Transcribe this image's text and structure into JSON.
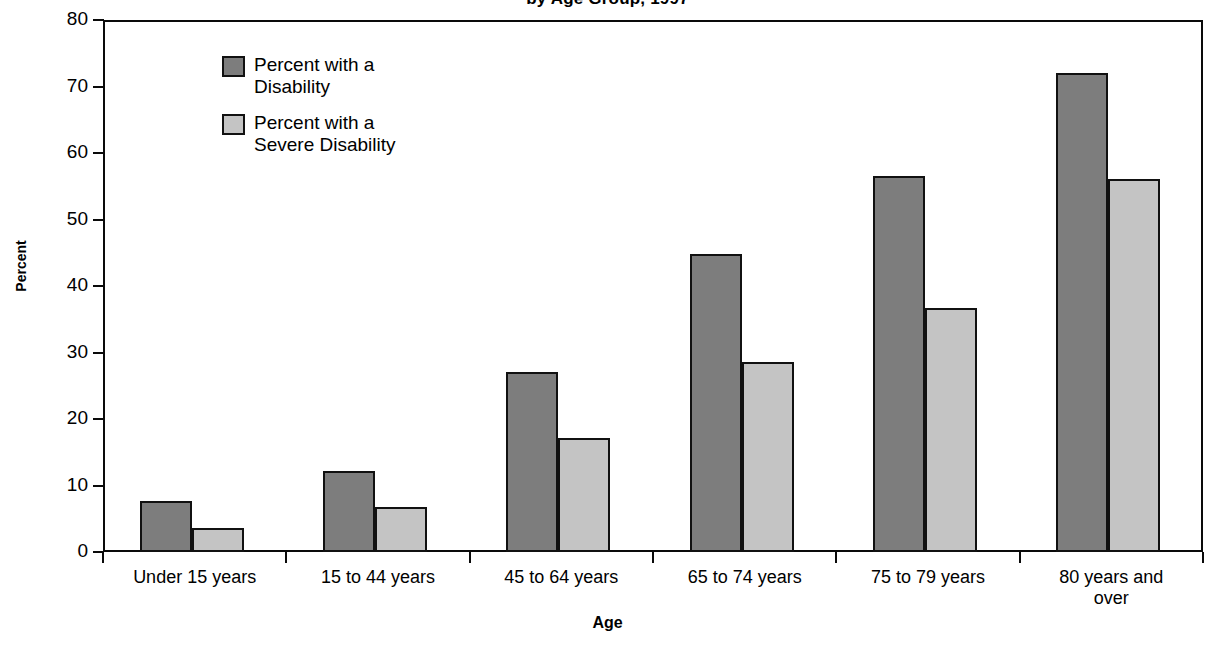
{
  "chart_data": {
    "type": "bar",
    "title": "by Age Group, 1997",
    "xlabel": "Age",
    "ylabel": "Percent",
    "ylim": [
      0,
      80
    ],
    "yticks": [
      0,
      10,
      20,
      30,
      40,
      50,
      60,
      70,
      80
    ],
    "grid": false,
    "legend_position": "inside-top-left",
    "categories": [
      "Under 15 years",
      "15 to 44 years",
      "45 to 64 years",
      "65 to 74 years",
      "75 to 79 years",
      "80 years and\nover"
    ],
    "series": [
      {
        "name": "Percent with a\nDisability",
        "color": "#7d7d7d",
        "values": [
          7.7,
          12.2,
          27.0,
          44.8,
          56.5,
          72.0
        ]
      },
      {
        "name": "Percent with a\nSevere Disability",
        "color": "#c4c4c4",
        "values": [
          3.6,
          6.7,
          17.1,
          28.5,
          36.7,
          56.1
        ]
      }
    ]
  },
  "colors": {
    "series_dark": "#7d7d7d",
    "series_light": "#c4c4c4",
    "axis": "#0a0a0a",
    "background": "#ffffff"
  }
}
